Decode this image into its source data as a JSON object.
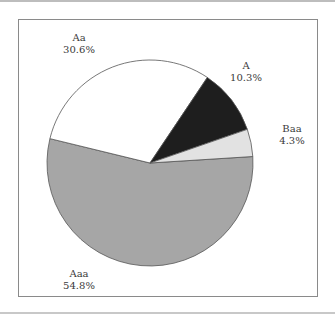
{
  "chart_data": {
    "type": "pie",
    "title": "",
    "categories": [
      "Aaa",
      "Aa",
      "A",
      "Baa"
    ],
    "values": [
      54.8,
      30.6,
      10.3,
      4.3
    ],
    "colors": [
      "#a6a6a6",
      "#ffffff",
      "#1e1e1e",
      "#e2e2e2"
    ],
    "labels": [
      {
        "name": "Aaa",
        "pct": "54.8%"
      },
      {
        "name": "Aa",
        "pct": "30.6%"
      },
      {
        "name": "A",
        "pct": "10.3%"
      },
      {
        "name": "Baa",
        "pct": "4.3%"
      }
    ],
    "legend": "none (direct labels)"
  }
}
